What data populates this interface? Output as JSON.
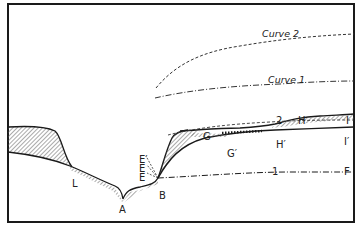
{
  "diagram": {
    "type": "geologic-cross-section",
    "colors": {
      "line": "#1a1a1a",
      "hatch": "#555555",
      "background": "#ffffff"
    },
    "curve_labels": {
      "curve2": "Curve 2",
      "curve1": "Curve 1"
    },
    "point_labels": {
      "A": "A",
      "B": "B",
      "L": "L",
      "E1": "E",
      "E2": "E",
      "E3": "E′",
      "G": "G",
      "G_prime": "G′",
      "H": "H",
      "H_prime": "H′",
      "I": "I",
      "I_prime": "I′",
      "F": "F",
      "num_2": "2",
      "num_1": "1"
    }
  }
}
